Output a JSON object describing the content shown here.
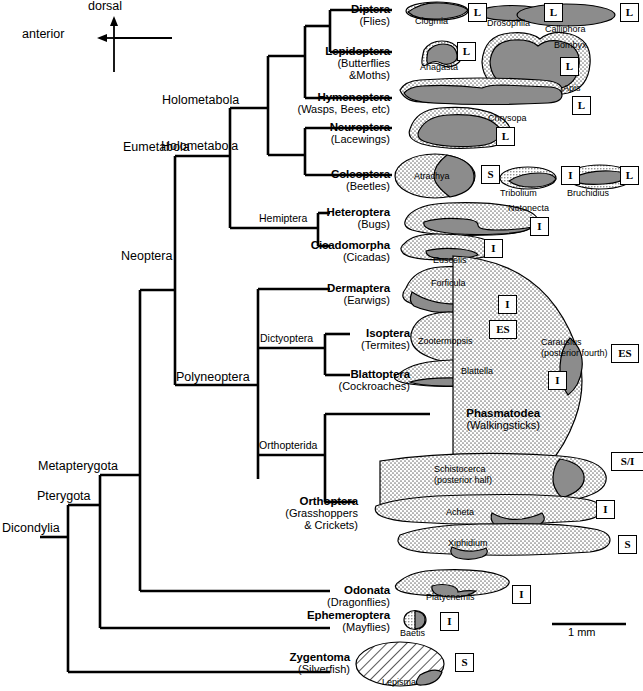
{
  "figure": {
    "orientation": {
      "dorsal": "dorsal",
      "anterior": "anterior"
    },
    "scale_bar": {
      "label": "1 mm"
    }
  },
  "clades": [
    {
      "name": "Dicondylia",
      "size": "large"
    },
    {
      "name": "Pterygota",
      "size": "large"
    },
    {
      "name": "Metapterygota",
      "size": "large"
    },
    {
      "name": "Neoptera",
      "size": "large"
    },
    {
      "name": "Eumetabola",
      "size": "large"
    },
    {
      "name": "Holometabola",
      "size": "large"
    },
    {
      "name": "Polyneoptera",
      "size": "large"
    },
    {
      "name": "Hemiptera",
      "size": "small"
    },
    {
      "name": "Dictyoptera",
      "size": "small"
    },
    {
      "name": "Orthopterida",
      "size": "small"
    }
  ],
  "orders": [
    {
      "name": "Diptera",
      "common": "(Flies)"
    },
    {
      "name": "Lepidoptera",
      "common": "(Butterflies",
      "common2": "&Moths)"
    },
    {
      "name": "Hymenoptera",
      "common": "(Wasps, Bees, etc)"
    },
    {
      "name": "Neuroptera",
      "common": "(Lacewings)"
    },
    {
      "name": "Coleoptera",
      "common": "(Beetles)"
    },
    {
      "name": "Heteroptera",
      "common": "(Bugs)"
    },
    {
      "name": "Cicadomorpha",
      "common": "(Cicadas)"
    },
    {
      "name": "Dermaptera",
      "common": "(Earwigs)"
    },
    {
      "name": "Isoptera",
      "common": "(Termites)"
    },
    {
      "name": "Blattoptera",
      "common": "(Cockroaches)"
    },
    {
      "name": "Phasmatodea",
      "common": "(Walkingsticks)"
    },
    {
      "name": "Orthoptera",
      "common": "(Grasshoppers",
      "common2": "& Crickets)"
    },
    {
      "name": "Odonata",
      "common": "(Dragonflies)"
    },
    {
      "name": "Ephemeroptera",
      "common": "(Mayflies)"
    },
    {
      "name": "Zygentoma",
      "common": "(Silverfish)"
    }
  ],
  "specimens": [
    {
      "genus": "Clogmia",
      "code": "L"
    },
    {
      "genus": "Drosophila",
      "code": "L"
    },
    {
      "genus": "Calliphora",
      "code": "L"
    },
    {
      "genus": "Anagasta",
      "code": "L"
    },
    {
      "genus": "Bombyx",
      "code": "L"
    },
    {
      "genus": "Apis",
      "code": "L"
    },
    {
      "genus": "Chrysopa",
      "code": "L"
    },
    {
      "genus": "Atrachya",
      "code": "S"
    },
    {
      "genus": "Tribolium",
      "code": "I"
    },
    {
      "genus": "Bruchidius",
      "code": "L"
    },
    {
      "genus": "Notonecta",
      "code": "I"
    },
    {
      "genus": "Euscelis",
      "code": "I"
    },
    {
      "genus": "Forficula",
      "code": "I"
    },
    {
      "genus": "Zootermopsis",
      "code": "ES"
    },
    {
      "genus": "Blattella",
      "code": "I"
    },
    {
      "genus": "Carausius",
      "genus2": "(posterior fourth)",
      "code": "ES"
    },
    {
      "genus": "Schistocerca",
      "genus2": "(posterior half)",
      "code": "S/I"
    },
    {
      "genus": "Acheta",
      "code": "I"
    },
    {
      "genus": "Xiphidium",
      "code": "S"
    },
    {
      "genus": "Platycnemis",
      "code": "I"
    },
    {
      "genus": "Baetis",
      "code": "I"
    },
    {
      "genus": "Lepisma",
      "code": "S"
    }
  ],
  "colors": {
    "line": "#000000",
    "dark_fill": "#8c8c8c",
    "stipple_fill": "#f2f2f2",
    "background": "#ffffff"
  }
}
